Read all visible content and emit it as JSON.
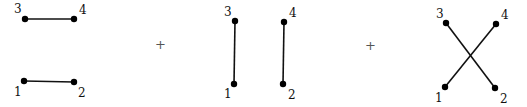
{
  "operator": "+",
  "diagrams": [
    {
      "name": "pairing-12-34",
      "edges": [
        [
          "1",
          "2"
        ],
        [
          "3",
          "4"
        ]
      ]
    },
    {
      "name": "pairing-13-24",
      "edges": [
        [
          "1",
          "3"
        ],
        [
          "2",
          "4"
        ]
      ]
    },
    {
      "name": "pairing-14-23",
      "edges": [
        [
          "1",
          "4"
        ],
        [
          "2",
          "3"
        ]
      ]
    }
  ],
  "node_labels": [
    "1",
    "2",
    "3",
    "4"
  ]
}
